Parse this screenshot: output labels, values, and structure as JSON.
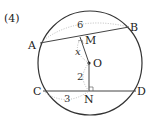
{
  "problem_number": "(4)",
  "points": {
    "A": "A",
    "B": "B",
    "C": "C",
    "D": "D",
    "M": "M",
    "N": "N",
    "O": "O"
  },
  "measures": {
    "AB_half_label": "6",
    "CN_label": "3",
    "ON_label": "2",
    "OM_label": "x"
  },
  "colors": {
    "stroke": "#333333",
    "dotted": "#aaaaaa"
  }
}
